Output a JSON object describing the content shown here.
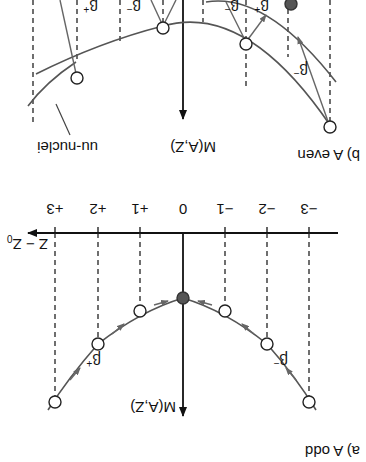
{
  "figure": {
    "orientation": "rotated-180",
    "panel_a": {
      "title": "a) A odd",
      "y_axis_label": "M(A,Z)",
      "x_axis_label": "Z − Z",
      "x_axis_label_sub": "0",
      "ticks": [
        "−3",
        "−2",
        "−1",
        "0",
        "+1",
        "+2",
        "+3"
      ],
      "beta_minus": "β",
      "beta_minus_sup": "−",
      "beta_plus": "β",
      "beta_plus_sup": "+",
      "stable_point": "0"
    },
    "panel_b": {
      "title": "b) A even",
      "y_axis_label": "M(A,Z)",
      "curve_label": "uu-nuclei",
      "beta_minus": "β",
      "beta_minus_sup": "−",
      "beta_plus": "β",
      "beta_plus_sup": "+"
    },
    "colors": {
      "line": "#555555",
      "axis": "#111111",
      "filled_node": "#555555",
      "background": "#ffffff"
    }
  }
}
